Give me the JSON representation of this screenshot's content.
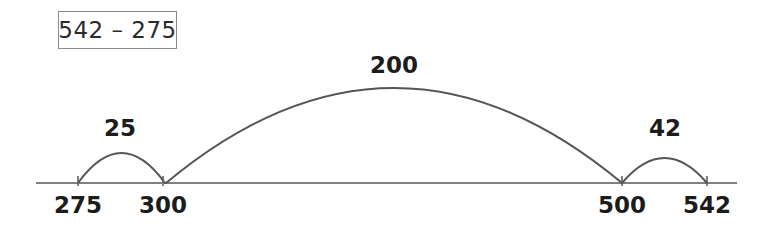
{
  "page": {
    "background_color": "#ffffff",
    "kind": "number-line-subtraction-worksheet"
  },
  "expression": {
    "text": "542 – 275",
    "box_border_color": "#8b8b8b"
  },
  "numberline": {
    "line_color": "#808080",
    "start_x": 36,
    "end_x": 737,
    "baseline_y": 183,
    "tick_color": "#808080",
    "ticks": [
      {
        "label": "275",
        "x": 78
      },
      {
        "label": "300",
        "x": 163
      },
      {
        "label": "500",
        "x": 622
      },
      {
        "label": "542",
        "x": 707
      }
    ]
  },
  "jumps": {
    "arc_color": "#555555",
    "items": [
      {
        "label": "25",
        "from_x": 78,
        "to_x": 165,
        "peak_y": 153,
        "label_x": 120,
        "label_y": 130
      },
      {
        "label": "200",
        "from_x": 166,
        "to_x": 622,
        "peak_y": 88,
        "label_x": 394,
        "label_y": 67
      },
      {
        "label": "42",
        "from_x": 622,
        "to_x": 707,
        "peak_y": 158,
        "label_x": 665,
        "label_y": 130
      }
    ]
  }
}
